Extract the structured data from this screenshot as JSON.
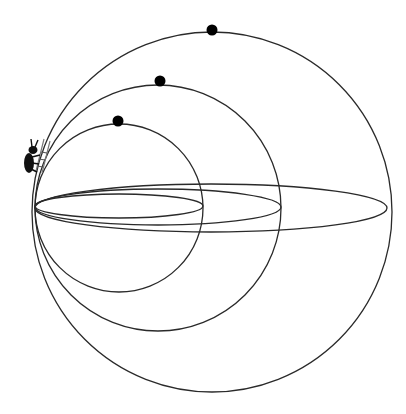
{
  "diagram": {
    "description": "Three nested circles tangent at a common left point, each with a black dot at its top, a tilted elliptical orbit for each, and a small ant figure climbing at the upper-left near the shared point",
    "colors": {
      "background": "#ffffff",
      "stroke": "#2a2a2a",
      "dot": "#000000",
      "ant": "#111111"
    },
    "tangent_point": {
      "x": 35,
      "y": 208
    },
    "circles": [
      {
        "name": "small",
        "cx": 119,
        "cy": 208,
        "r": 84,
        "dot": {
          "x": 118,
          "y": 121
        }
      },
      {
        "name": "medium",
        "cx": 158,
        "cy": 208,
        "r": 123,
        "dot": {
          "x": 160,
          "y": 81
        }
      },
      {
        "name": "large",
        "cx": 212,
        "cy": 212,
        "r": 180,
        "dot": {
          "x": 212,
          "y": 30
        }
      }
    ],
    "ellipses": [
      {
        "name": "small-orbit",
        "cx": 119,
        "cy": 206,
        "rx": 84,
        "ry": 12
      },
      {
        "name": "medium-orbit",
        "cx": 158,
        "cy": 207,
        "rx": 123,
        "ry": 18
      },
      {
        "name": "large-orbit",
        "cx": 211,
        "cy": 208,
        "rx": 176,
        "ry": 24
      }
    ],
    "figure": {
      "name": "ant",
      "x": 28,
      "y": 150
    }
  }
}
